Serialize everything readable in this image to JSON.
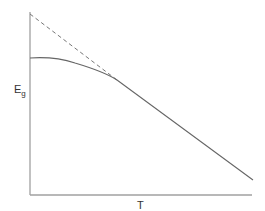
{
  "diagram": {
    "y_axis": {
      "label": "E",
      "label_sub": "g"
    },
    "x_axis": {
      "label": "T"
    },
    "curves": [
      {
        "name": "actual band gap",
        "style": "solid",
        "description": "flat at low T, curves down, becomes linear at high T"
      },
      {
        "name": "linear extrapolation",
        "style": "dashed",
        "description": "extrapolation of high-T linear region back to T=0"
      }
    ],
    "colors": {
      "axis": "#999999",
      "curve": "#666666",
      "text": "#333333"
    }
  }
}
